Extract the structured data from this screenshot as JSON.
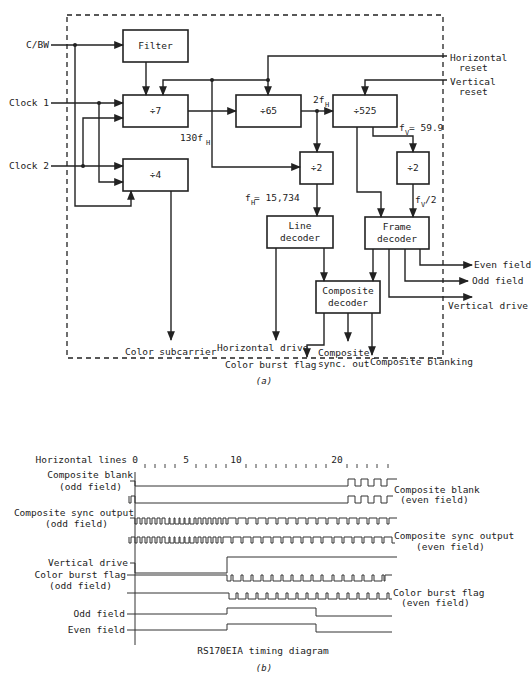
{
  "figure_a": {
    "caption": "(a)",
    "inputs": {
      "cbw": "C/BW",
      "clock1": "Clock 1",
      "clock2": "Clock 2"
    },
    "blocks": {
      "filter": "Filter",
      "div7": "÷7",
      "div4": "÷4",
      "div65": "÷65",
      "div525": "÷525",
      "div2_left": "÷2",
      "div2_right": "÷2",
      "line_decoder_1": "Line",
      "line_decoder_2": "decoder",
      "frame_decoder_1": "Frame",
      "frame_decoder_2": "decoder",
      "composite_decoder_1": "Composite",
      "composite_decoder_2": "decoder"
    },
    "signal_labels": {
      "f130h": "130f",
      "f130h_sub": "H",
      "f2h": "2f",
      "f2h_sub": "H",
      "fv": "f",
      "fv_sub": "V",
      "fv_value": " = 59.9",
      "fh": "f",
      "fh_sub": "H",
      "fh_value": " = 15,734",
      "fv2": "f",
      "fv2_sub": "V",
      "fv2_suffix": "/2"
    },
    "resets": {
      "horizontal_1": "Horizontal",
      "horizontal_2": "reset",
      "vertical_1": "Vertical",
      "vertical_2": "reset"
    },
    "outputs": {
      "even_field": "Even field",
      "odd_field": "Odd field",
      "vertical_drive": "Vertical drive",
      "color_subcarrier": "Color subcarrier",
      "horizontal_drive": "Horizontal drive",
      "color_burst_flag": "Color burst flag",
      "composite_sync_1": "Composite",
      "composite_sync_2": "sync. out",
      "composite_blanking": "Composite blanking"
    }
  },
  "figure_b": {
    "caption": "(b)",
    "title": "RS170EIA timing diagram",
    "axis_label": "Horizontal lines",
    "ticks": [
      "0",
      "5",
      "10",
      "20"
    ],
    "signals": {
      "composite_blank_odd_1": "Composite blank",
      "composite_blank_odd_2": "(odd field)",
      "composite_blank_even_1": "Composite blank",
      "composite_blank_even_2": "(even field)",
      "composite_sync_odd_1": "Composite sync output",
      "composite_sync_odd_2": "(odd field)",
      "composite_sync_even_1": "Composite sync output",
      "composite_sync_even_2": "(even field)",
      "vertical_drive": "Vertical drive",
      "color_burst_odd_1": "Color burst flag",
      "color_burst_odd_2": "(odd field)",
      "color_burst_even_1": "Color burst flag",
      "color_burst_even_2": "(even field)",
      "odd_field": "Odd field",
      "even_field": "Even field"
    }
  }
}
